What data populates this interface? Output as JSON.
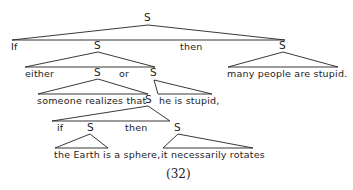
{
  "diagram": {
    "type": "syntax-tree",
    "caption": "(32)",
    "node_label": "S",
    "words": {
      "if_top": "If",
      "then_top": "then",
      "either": "either",
      "or": "or",
      "many_people": "many people are stupid.",
      "someone_realizes": "someone realizes that",
      "he_is_stupid": "he is stupid,",
      "if_inner": "if",
      "then_inner": "then",
      "earth_sphere": "the Earth is a sphere,",
      "rotates": "it necessarily rotates"
    },
    "nodes": [
      {
        "id": "S-root",
        "children": [
          "If",
          "S-either-or",
          "then",
          "S-many"
        ]
      },
      {
        "id": "S-either-or",
        "children": [
          "either",
          "S-someone",
          "or",
          "S-he"
        ]
      },
      {
        "id": "S-many",
        "children": [
          "many people are stupid."
        ]
      },
      {
        "id": "S-someone",
        "children": [
          "someone realizes that",
          "S-if-then"
        ]
      },
      {
        "id": "S-he",
        "children": [
          "he is stupid,"
        ]
      },
      {
        "id": "S-if-then",
        "children": [
          "if",
          "S-earth",
          "then",
          "S-rotates"
        ]
      },
      {
        "id": "S-earth",
        "children": [
          "the Earth is a sphere,"
        ]
      },
      {
        "id": "S-rotates",
        "children": [
          "it necessarily rotates"
        ]
      }
    ]
  }
}
